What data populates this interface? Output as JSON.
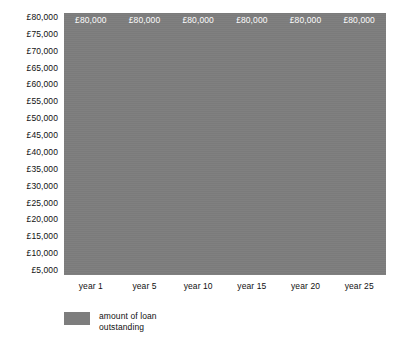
{
  "chart_data": {
    "type": "bar",
    "title": "",
    "subtitle": "",
    "xlabel": "",
    "ylabel": "",
    "categories": [
      "year 1",
      "year 5",
      "year 10",
      "year 15",
      "year 20",
      "year 25"
    ],
    "values": [
      80000,
      80000,
      80000,
      80000,
      80000,
      80000
    ],
    "data_labels": [
      "£80,000",
      "£80,000",
      "£80,000",
      "£80,000",
      "£80,000",
      "£80,000"
    ],
    "series": [
      {
        "name": "amount of loan outstanding",
        "values": [
          80000,
          80000,
          80000,
          80000,
          80000,
          80000
        ],
        "color": "#7d7d7d"
      }
    ],
    "ylim": [
      5000,
      80000
    ],
    "ytick_labels": [
      "£80,000",
      "£75,000",
      "£70,000",
      "£65,000",
      "£60,000",
      "£55,000",
      "£50,000",
      "£45,000",
      "£40,000",
      "£35,000",
      "£30,000",
      "£25,000",
      "£20,000",
      "£15,000",
      "£10,000",
      "£5,000"
    ],
    "ytick_values": [
      80000,
      75000,
      70000,
      65000,
      60000,
      55000,
      50000,
      45000,
      40000,
      35000,
      30000,
      25000,
      20000,
      15000,
      10000,
      5000
    ],
    "grid": false,
    "legend_position": "bottom-left",
    "legend_entries": [
      {
        "label": "amount of loan\noutstanding",
        "color": "#7d7d7d"
      }
    ],
    "plot_background": "#7d7d7d",
    "page_background": "#ffffff",
    "data_label_color": "#ffffff",
    "axis_text_color": "#111111"
  }
}
